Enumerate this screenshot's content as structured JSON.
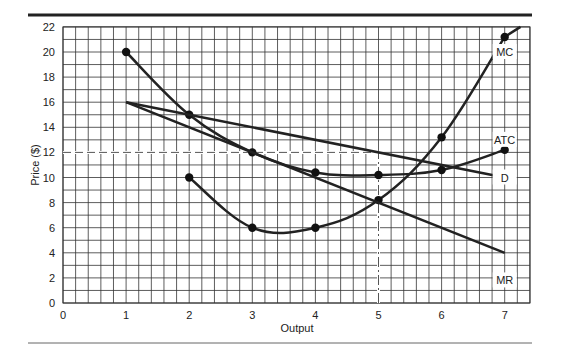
{
  "chart_data": {
    "type": "line",
    "title": "",
    "xlabel": "Output",
    "ylabel": "Price ($)",
    "xlim": [
      0,
      7.4
    ],
    "ylim": [
      0,
      22
    ],
    "xticks": [
      0,
      1,
      2,
      3,
      4,
      5,
      6,
      7
    ],
    "yticks": [
      0,
      2,
      4,
      6,
      8,
      10,
      12,
      14,
      16,
      18,
      20,
      22
    ],
    "grid": true,
    "grid_minor_x": 0.2,
    "grid_minor_y": 1,
    "series": [
      {
        "name": "MC",
        "x": [
          2,
          3,
          4,
          5,
          6,
          7
        ],
        "y": [
          10,
          6,
          6,
          8.2,
          13.2,
          21.2
        ],
        "label_at": [
          7,
          20
        ]
      },
      {
        "name": "ATC",
        "x": [
          1,
          2,
          3,
          4,
          5,
          6,
          7
        ],
        "y": [
          20,
          15,
          12,
          10.4,
          10.2,
          10.6,
          12.2
        ],
        "label_at": [
          7,
          13
        ]
      },
      {
        "name": "D",
        "x": [
          1,
          7
        ],
        "y": [
          16,
          10
        ],
        "label_at": [
          7,
          10
        ]
      },
      {
        "name": "MR",
        "x": [
          1,
          7
        ],
        "y": [
          16,
          4
        ],
        "label_at": [
          7,
          1.8
        ]
      }
    ],
    "reference_lines": [
      {
        "type": "horizontal",
        "y": 12,
        "x_from": 0,
        "x_to": 5,
        "style": "dashed"
      },
      {
        "type": "vertical",
        "x": 5,
        "y_from": 0,
        "y_to": 12,
        "style": "dash-dot"
      }
    ]
  }
}
